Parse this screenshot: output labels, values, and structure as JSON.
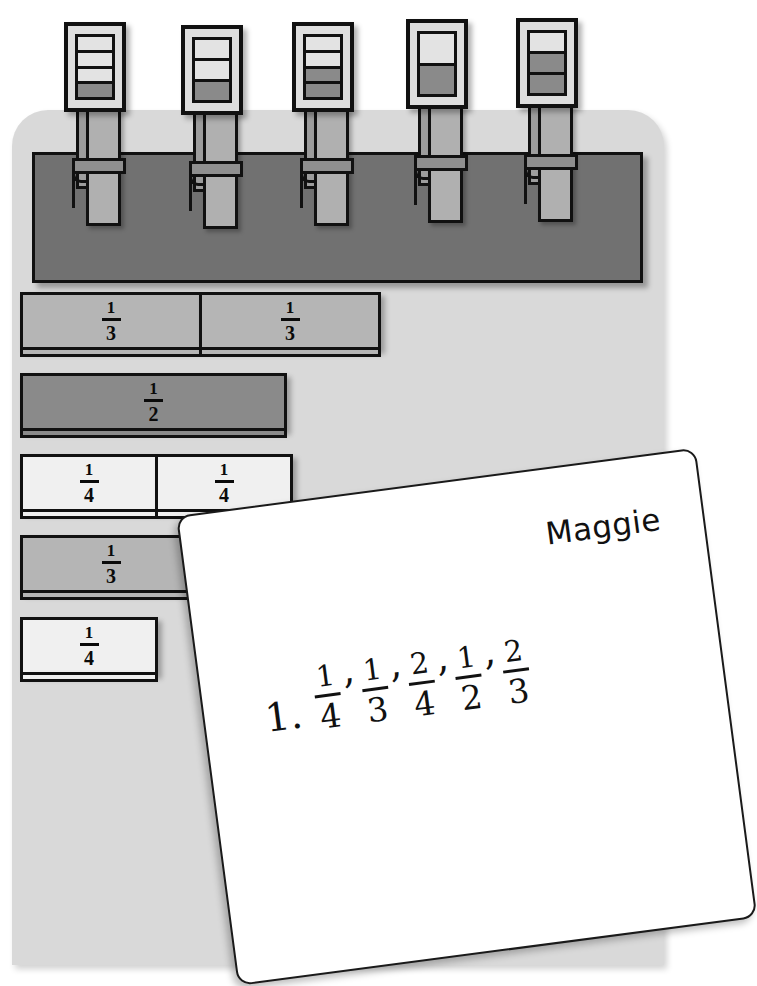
{
  "scene": {
    "title": "Fraction cards on a clothesline with student note",
    "board_color": "#d9d9d9",
    "rail_color": "#717171"
  },
  "clothesline": {
    "name": "rail",
    "cards": [
      {
        "id": "card-1",
        "segments": 4,
        "shaded": 1,
        "fraction": "1/4",
        "left": 64,
        "top": 22,
        "body_color": "#dedede",
        "shade_color": "#8a8a8a"
      },
      {
        "id": "card-2",
        "segments": 3,
        "shaded": 1,
        "fraction": "1/3",
        "left": 181,
        "top": 25,
        "body_color": "#dedede",
        "shade_color": "#8a8a8a"
      },
      {
        "id": "card-3",
        "segments": 4,
        "shaded": 2,
        "fraction": "2/4",
        "left": 292,
        "top": 22,
        "body_color": "#dedede",
        "shade_color": "#8a8a8a"
      },
      {
        "id": "card-4",
        "segments": 2,
        "shaded": 1,
        "fraction": "1/2",
        "left": 406,
        "top": 19,
        "body_color": "#dedede",
        "shade_color": "#8a8a8a"
      },
      {
        "id": "card-5",
        "segments": 3,
        "shaded": 2,
        "fraction": "2/3",
        "left": 516,
        "top": 18,
        "body_color": "#dedede",
        "shade_color": "#8a8a8a"
      }
    ]
  },
  "fraction_tiles": {
    "rows": [
      {
        "id": "tile-row-1",
        "left": 20,
        "top": 292,
        "height": 58,
        "tiles": [
          {
            "num": "1",
            "den": "3",
            "width": 182,
            "color": "#b5b5b5"
          },
          {
            "num": "1",
            "den": "3",
            "width": 182,
            "color": "#b5b5b5"
          }
        ]
      },
      {
        "id": "tile-row-2",
        "left": 20,
        "top": 373,
        "height": 58,
        "tiles": [
          {
            "num": "1",
            "den": "2",
            "width": 267,
            "color": "#8a8a8a"
          }
        ]
      },
      {
        "id": "tile-row-3",
        "left": 20,
        "top": 454,
        "height": 58,
        "tiles": [
          {
            "num": "1",
            "den": "4",
            "width": 138,
            "color": "#f0f0f0"
          },
          {
            "num": "1",
            "den": "4",
            "width": 138,
            "color": "#f0f0f0"
          }
        ]
      },
      {
        "id": "tile-row-4",
        "left": 20,
        "top": 535,
        "height": 58,
        "tiles": [
          {
            "num": "1",
            "den": "3",
            "width": 182,
            "color": "#b5b5b5"
          }
        ]
      },
      {
        "id": "tile-row-5",
        "left": 20,
        "top": 617,
        "height": 58,
        "tiles": [
          {
            "num": "1",
            "den": "4",
            "width": 138,
            "color": "#f0f0f0"
          }
        ]
      }
    ]
  },
  "note": {
    "student_name": "Maggie",
    "item_number": "1.",
    "answer_sequence": [
      {
        "num": "1",
        "den": "4"
      },
      {
        "num": "1",
        "den": "3"
      },
      {
        "num": "2",
        "den": "4"
      },
      {
        "num": "1",
        "den": "2"
      },
      {
        "num": "2",
        "den": "3"
      }
    ],
    "separator": ",",
    "answer_text": "1. 1/4, 1/3, 2/4, 1/2, 2/3",
    "paper_color": "#ffffff"
  }
}
